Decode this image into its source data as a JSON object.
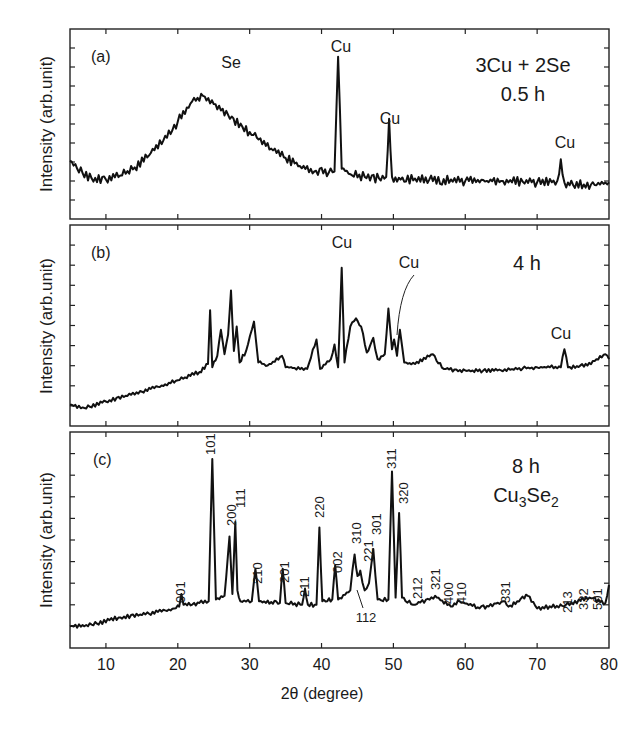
{
  "figure": {
    "x_axis_title": "2θ (degree)",
    "x_tick_labels": [
      "10",
      "20",
      "30",
      "40",
      "50",
      "60",
      "70",
      "80"
    ],
    "y_axis_title": "Intensity (arb.unit)"
  },
  "panels": [
    {
      "label": "(a)",
      "condition_line1": "3Cu + 2Se",
      "condition_line2": "0.5 h",
      "annotations": [
        {
          "text": "Se",
          "deg": 23.5
        },
        {
          "text": "Cu",
          "deg": 42.3
        },
        {
          "text": "Cu",
          "deg": 49.4
        },
        {
          "text": "Cu",
          "deg": 73.5
        }
      ]
    },
    {
      "label": "(b)",
      "condition_line1": "4 h",
      "annotations": [
        {
          "text": "Cu",
          "deg": 42.8
        },
        {
          "text": "Cu",
          "deg": 50.1
        },
        {
          "text": "Cu",
          "deg": 73.8
        }
      ]
    },
    {
      "label": "(c)",
      "condition_line1": "8 h",
      "formula": {
        "base1": "Cu",
        "sub1": "3",
        "base2": "Se",
        "sub2": "2"
      },
      "hkl_labels": [
        "001",
        "101",
        "200",
        "111",
        "210",
        "201",
        "211",
        "220",
        "002",
        "310",
        "221",
        "301",
        "311",
        "320",
        "212",
        "321",
        "400",
        "410",
        "331",
        "213",
        "332",
        "501",
        "112"
      ]
    }
  ],
  "chart_data": [
    {
      "type": "line",
      "title": "(a) 3Cu + 2Se, 0.5 h",
      "xlabel": "2θ (degree)",
      "ylabel": "Intensity (arb.unit)",
      "xlim": [
        5,
        80
      ],
      "grid": false,
      "x": [
        5,
        6,
        8,
        10,
        12,
        14,
        16,
        18,
        20,
        22,
        23.5,
        25,
        27,
        29,
        31,
        33,
        35,
        37,
        39,
        41,
        41.8,
        42.3,
        42.8,
        44,
        46,
        48,
        49,
        49.4,
        49.8,
        51,
        55,
        60,
        65,
        70,
        72.8,
        73.3,
        73.8,
        75,
        78,
        80
      ],
      "values": [
        0.18,
        0.12,
        0.05,
        0.04,
        0.07,
        0.13,
        0.22,
        0.33,
        0.47,
        0.62,
        0.66,
        0.6,
        0.52,
        0.43,
        0.35,
        0.27,
        0.2,
        0.14,
        0.1,
        0.09,
        0.1,
        0.95,
        0.12,
        0.08,
        0.06,
        0.05,
        0.06,
        0.49,
        0.06,
        0.04,
        0.04,
        0.03,
        0.03,
        0.02,
        0.03,
        0.19,
        0.02,
        0.0,
        0.0,
        0.02
      ],
      "annotations": [
        "Se (broad hump ~23°)",
        "Cu ~42.3°",
        "Cu ~49.4°",
        "Cu ~73.5°"
      ]
    },
    {
      "type": "line",
      "title": "(b) 4 h",
      "xlabel": "2θ (degree)",
      "ylabel": "Intensity (arb.unit)",
      "xlim": [
        5,
        80
      ],
      "grid": false,
      "x": [
        5,
        7,
        10,
        15,
        20,
        23,
        24.2,
        24.5,
        24.8,
        25.5,
        26,
        26.5,
        27,
        27.4,
        27.8,
        28.2,
        28.6,
        29.5,
        30.6,
        31.2,
        32.5,
        34.5,
        35,
        38,
        39.3,
        39.8,
        41.3,
        41.8,
        42.3,
        42.8,
        43.2,
        44,
        44.8,
        45.5,
        46.3,
        47.2,
        47.8,
        48.8,
        49.3,
        49.8,
        50.1,
        50.5,
        50.9,
        51.5,
        53,
        55.5,
        56,
        57,
        60,
        65,
        70,
        73.3,
        73.8,
        74.3,
        77,
        79.5,
        80
      ],
      "values": [
        0.02,
        0.0,
        0.04,
        0.1,
        0.17,
        0.22,
        0.27,
        0.6,
        0.25,
        0.32,
        0.48,
        0.33,
        0.45,
        0.72,
        0.35,
        0.5,
        0.28,
        0.35,
        0.53,
        0.28,
        0.26,
        0.32,
        0.25,
        0.24,
        0.42,
        0.24,
        0.3,
        0.39,
        0.25,
        0.86,
        0.28,
        0.5,
        0.55,
        0.5,
        0.34,
        0.43,
        0.3,
        0.33,
        0.61,
        0.36,
        0.42,
        0.32,
        0.48,
        0.28,
        0.27,
        0.33,
        0.29,
        0.24,
        0.23,
        0.23,
        0.25,
        0.25,
        0.36,
        0.25,
        0.26,
        0.33,
        0.3
      ],
      "annotations": [
        "Cu ~42.8°",
        "Cu ~50.1°",
        "Cu ~73.8°"
      ]
    },
    {
      "type": "line",
      "title": "(c) 8 h, Cu3Se2",
      "xlabel": "2θ (degree)",
      "ylabel": "Intensity (arb.unit)",
      "xlim": [
        5,
        80
      ],
      "xticks": [
        10,
        20,
        30,
        40,
        50,
        60,
        70,
        80
      ],
      "grid": false,
      "x": [
        5,
        8,
        12,
        16,
        19.5,
        20.2,
        20.5,
        20.8,
        23,
        24.3,
        24.8,
        25.3,
        26.5,
        27.2,
        27.6,
        28.0,
        28.3,
        28.7,
        30.3,
        30.8,
        31.3,
        34.2,
        34.6,
        35.0,
        37.3,
        37.7,
        38.1,
        39.3,
        39.7,
        40.1,
        41.5,
        41.9,
        42.3,
        44.0,
        44.6,
        45.0,
        45.4,
        46.0,
        46.6,
        47.2,
        47.8,
        49.3,
        49.8,
        50.3,
        50.8,
        51.2,
        51.7,
        53.0,
        55.8,
        58,
        59.2,
        62,
        65.3,
        66,
        68.7,
        70,
        74,
        77.3,
        79.5,
        80
      ],
      "values": [
        0.02,
        0.03,
        0.07,
        0.09,
        0.12,
        0.13,
        0.2,
        0.14,
        0.15,
        0.16,
        0.95,
        0.17,
        0.19,
        0.52,
        0.2,
        0.6,
        0.22,
        0.16,
        0.16,
        0.34,
        0.16,
        0.15,
        0.34,
        0.15,
        0.14,
        0.23,
        0.14,
        0.14,
        0.57,
        0.16,
        0.17,
        0.36,
        0.17,
        0.22,
        0.42,
        0.3,
        0.33,
        0.22,
        0.26,
        0.45,
        0.17,
        0.17,
        0.88,
        0.18,
        0.65,
        0.18,
        0.16,
        0.14,
        0.19,
        0.13,
        0.16,
        0.12,
        0.16,
        0.13,
        0.19,
        0.12,
        0.14,
        0.18,
        0.15,
        0.25
      ],
      "peaks_hkl": [
        {
          "hkl": "001",
          "deg": 20.5
        },
        {
          "hkl": "101",
          "deg": 24.8
        },
        {
          "hkl": "200",
          "deg": 27.6
        },
        {
          "hkl": "111",
          "deg": 28.3
        },
        {
          "hkl": "210",
          "deg": 30.8
        },
        {
          "hkl": "201",
          "deg": 34.6
        },
        {
          "hkl": "211",
          "deg": 37.7
        },
        {
          "hkl": "220",
          "deg": 39.7
        },
        {
          "hkl": "002",
          "deg": 41.9
        },
        {
          "hkl": "310",
          "deg": 44.6
        },
        {
          "hkl": "112",
          "deg": 45.4
        },
        {
          "hkl": "221",
          "deg": 46.0
        },
        {
          "hkl": "301",
          "deg": 47.2
        },
        {
          "hkl": "311",
          "deg": 49.8
        },
        {
          "hkl": "320",
          "deg": 51.2
        },
        {
          "hkl": "212",
          "deg": 53.0
        },
        {
          "hkl": "321",
          "deg": 55.8
        },
        {
          "hkl": "400",
          "deg": 58.0
        },
        {
          "hkl": "410",
          "deg": 59.2
        },
        {
          "hkl": "331",
          "deg": 65.3
        },
        {
          "hkl": "213",
          "deg": 74.0
        },
        {
          "hkl": "332",
          "deg": 77.3
        },
        {
          "hkl": "501",
          "deg": 79.5
        }
      ]
    }
  ]
}
